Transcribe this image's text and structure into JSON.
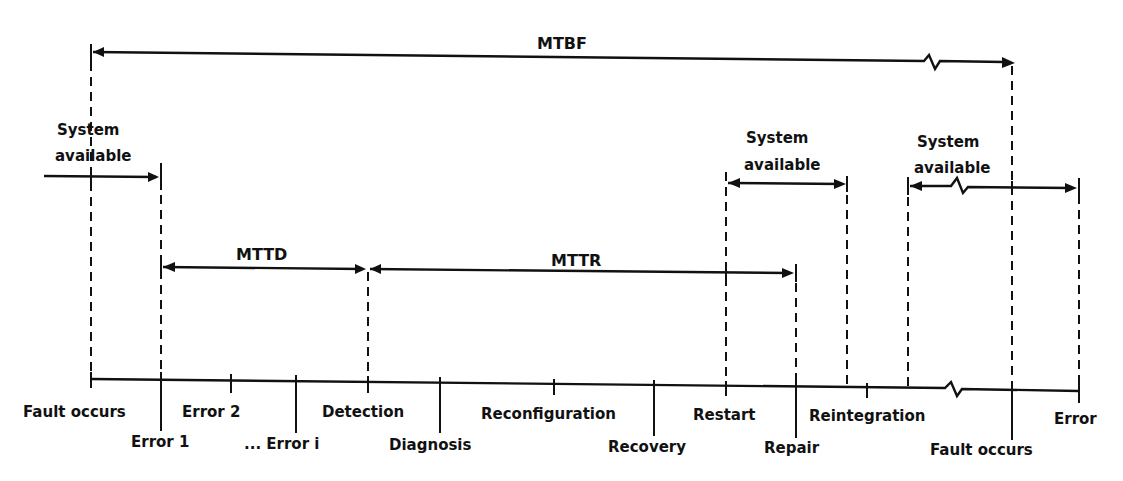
{
  "diagram": {
    "type": "fault-tolerance-timeline",
    "intervals": {
      "mtbf": {
        "label": "MTBF"
      },
      "mttd": {
        "label": "MTTD"
      },
      "mttr": {
        "label": "MTTR"
      },
      "available_1": {
        "label_line1": "System",
        "label_line2": "available"
      },
      "available_2": {
        "label_line1": "System",
        "label_line2": "available"
      },
      "available_3": {
        "label_line1": "System",
        "label_line2": "available"
      }
    },
    "timeline_events": {
      "upper": [
        {
          "label": "Fault occurs"
        },
        {
          "label": "Error 2"
        },
        {
          "label": "Detection"
        },
        {
          "label": "Reconfiguration"
        },
        {
          "label": "Restart"
        },
        {
          "label": "Reintegration"
        },
        {
          "label": "Error"
        }
      ],
      "lower": [
        {
          "label": "Error 1"
        },
        {
          "label": "... Error i"
        },
        {
          "label": "Diagnosis"
        },
        {
          "label": "Recovery"
        },
        {
          "label": "Repair"
        },
        {
          "label": "Fault occurs"
        }
      ]
    },
    "colors": {
      "ink": "#111111",
      "background": "#ffffff"
    }
  }
}
